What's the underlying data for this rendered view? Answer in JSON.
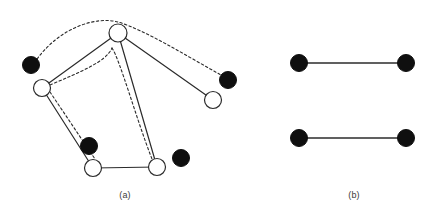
{
  "figure": {
    "background_color": "#ffffff",
    "stroke_color": "#2b2b2b",
    "filled_node_color": "#0f0f0f",
    "open_node_fill": "#ffffff",
    "caption_color": "#3b3b3b"
  },
  "panels": [
    {
      "id": "a",
      "caption": "(a)",
      "nodes": [
        {
          "id": "a1",
          "type": "filled",
          "cx": 31,
          "cy": 65,
          "r": 8.5
        },
        {
          "id": "a2",
          "type": "open",
          "cx": 42,
          "cy": 88,
          "r": 8.5
        },
        {
          "id": "a3",
          "type": "open",
          "cx": 118,
          "cy": 33,
          "r": 9.0
        },
        {
          "id": "a4",
          "type": "filled",
          "cx": 228,
          "cy": 80,
          "r": 8.5
        },
        {
          "id": "a5",
          "type": "open",
          "cx": 213,
          "cy": 100,
          "r": 8.5
        },
        {
          "id": "a6",
          "type": "filled",
          "cx": 89,
          "cy": 146,
          "r": 8.5
        },
        {
          "id": "a7",
          "type": "open",
          "cx": 93,
          "cy": 168,
          "r": 8.5
        },
        {
          "id": "a8",
          "type": "open",
          "cx": 157,
          "cy": 167,
          "r": 8.5
        },
        {
          "id": "a9",
          "type": "filled",
          "cx": 181,
          "cy": 158,
          "r": 8.5
        }
      ],
      "solid_edges": [
        {
          "from": "a2",
          "to": "a3"
        },
        {
          "from": "a2",
          "to": "a7"
        },
        {
          "from": "a3",
          "to": "a8"
        },
        {
          "from": "a3",
          "to": "a5"
        },
        {
          "from": "a7",
          "to": "a8"
        }
      ],
      "dashed_curves": [
        {
          "name": "outer-arc-left-black-to-right-black",
          "path": "M 37 59 C 60 28 95 16 118 22 C 145 30 185 55 221 75"
        },
        {
          "name": "inner-arc-left-white-to-top-bend",
          "path": "M 50 85 C 80 72 106 62 112 48"
        },
        {
          "name": "inner-arc-top-bend-to-bottom-right",
          "path": "M 112 48 C 120 60 136 118 152 159"
        },
        {
          "name": "inner-line-left-white-to-bottom-left",
          "path": "M 50 92 L 95 159"
        }
      ]
    },
    {
      "id": "b",
      "caption": "(b)",
      "nodes": [
        {
          "id": "b1",
          "type": "filled",
          "cx": 299,
          "cy": 63,
          "r": 8.5
        },
        {
          "id": "b2",
          "type": "filled",
          "cx": 406,
          "cy": 63,
          "r": 8.5
        },
        {
          "id": "b3",
          "type": "filled",
          "cx": 299,
          "cy": 138,
          "r": 8.5
        },
        {
          "id": "b4",
          "type": "filled",
          "cx": 406,
          "cy": 138,
          "r": 8.5
        }
      ],
      "solid_edges": [
        {
          "from": "b1",
          "to": "b2"
        },
        {
          "from": "b3",
          "to": "b4"
        }
      ],
      "dashed_curves": []
    }
  ]
}
